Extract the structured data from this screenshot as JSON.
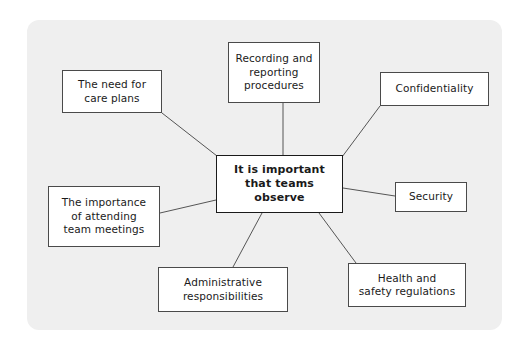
{
  "diagram": {
    "title": "It is important that teams observe",
    "type": "mind-map",
    "panel": {
      "background_color": "#efefef"
    },
    "center": {
      "id": "center",
      "label": "It is important\nthat teams\nobserve",
      "x": 216,
      "y": 155,
      "w": 127,
      "h": 58
    },
    "nodes": [
      {
        "id": "care-plans",
        "label": "The need for\ncare plans",
        "x": 62,
        "y": 70,
        "w": 100,
        "h": 43
      },
      {
        "id": "recording",
        "label": "Recording and\nreporting\nprocedures",
        "x": 228,
        "y": 42,
        "w": 92,
        "h": 61
      },
      {
        "id": "confidentiality",
        "label": "Confidentiality",
        "x": 380,
        "y": 72,
        "w": 109,
        "h": 34
      },
      {
        "id": "team-meetings",
        "label": "The importance\nof attending\nteam meetings",
        "x": 48,
        "y": 186,
        "w": 112,
        "h": 61
      },
      {
        "id": "security",
        "label": "Security",
        "x": 395,
        "y": 182,
        "w": 72,
        "h": 30
      },
      {
        "id": "administrative",
        "label": "Administrative\nresponsibilities",
        "x": 158,
        "y": 267,
        "w": 130,
        "h": 45
      },
      {
        "id": "health-safety",
        "label": "Health and\nsafety regulations",
        "x": 348,
        "y": 263,
        "w": 118,
        "h": 44
      }
    ],
    "edges": [
      {
        "from": "care-plans",
        "to": "center",
        "x1": 162,
        "y1": 113,
        "x2": 217,
        "y2": 156
      },
      {
        "from": "recording",
        "to": "center",
        "x1": 283,
        "y1": 103,
        "x2": 283,
        "y2": 155
      },
      {
        "from": "confidentiality",
        "to": "center",
        "x1": 380,
        "y1": 106,
        "x2": 342,
        "y2": 157
      },
      {
        "from": "team-meetings",
        "to": "center",
        "x1": 160,
        "y1": 213,
        "x2": 216,
        "y2": 200
      },
      {
        "from": "security",
        "to": "center",
        "x1": 395,
        "y1": 196,
        "x2": 343,
        "y2": 188
      },
      {
        "from": "administrative",
        "to": "center",
        "x1": 233,
        "y1": 267,
        "x2": 262,
        "y2": 213
      },
      {
        "from": "health-safety",
        "to": "center",
        "x1": 356,
        "y1": 263,
        "x2": 319,
        "y2": 213
      }
    ],
    "colors": {
      "node_border": "#4a4a4a",
      "center_border": "#1a1a1a",
      "node_fill": "#ffffff",
      "edge": "#555555",
      "text": "#1a1a1a"
    }
  }
}
